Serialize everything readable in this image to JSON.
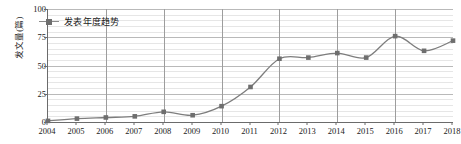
{
  "chart_data": {
    "type": "line",
    "title": "",
    "xlabel": "",
    "ylabel": "发文量(篇)",
    "legend": [
      "发表年度趋势"
    ],
    "legend_position": "top-left-inside",
    "grid": true,
    "grid_horizontal_minor": true,
    "grid_vertical_every": 2,
    "categories": [
      2004,
      2005,
      2006,
      2007,
      2008,
      2009,
      2010,
      2011,
      2012,
      2013,
      2014,
      2015,
      2016,
      2017,
      2018
    ],
    "x": [
      "2004",
      "2005",
      "2006",
      "2007",
      "2008",
      "2009",
      "2010",
      "2011",
      "2012",
      "2013",
      "2014",
      "2015",
      "2016",
      "2017",
      "2018"
    ],
    "values": [
      1,
      3,
      4,
      5,
      9,
      6,
      14,
      31,
      56,
      57,
      61,
      57,
      76,
      63,
      72
    ],
    "series": [
      {
        "name": "发表年度趋势",
        "values": [
          1,
          3,
          4,
          5,
          9,
          6,
          14,
          31,
          56,
          57,
          61,
          57,
          76,
          63,
          72
        ],
        "color": "#7d7d7d",
        "marker": "square",
        "marker_color": "#6e6e6e"
      }
    ],
    "ylim": [
      0,
      100
    ],
    "yticks": [
      0,
      25,
      50,
      75,
      100
    ],
    "ytick_labels": [
      "0",
      "25",
      "50",
      "75",
      "100"
    ],
    "xlim": [
      2004,
      2018
    ],
    "xticks": [
      "2004",
      "2005",
      "2006",
      "2007",
      "2008",
      "2009",
      "2010",
      "2011",
      "2012",
      "2013",
      "2014",
      "2015",
      "2016",
      "2017",
      "2018"
    ]
  },
  "colors": {
    "line": "#7d7d7d",
    "marker": "#6e6e6e",
    "axis": "#6b6b6b",
    "grid_major": "#b9b9b9",
    "grid_minor": "#e6e6e6",
    "grid_vertical": "#9d9d9d",
    "background": "#ffffff",
    "text": "#1a1a1a"
  }
}
